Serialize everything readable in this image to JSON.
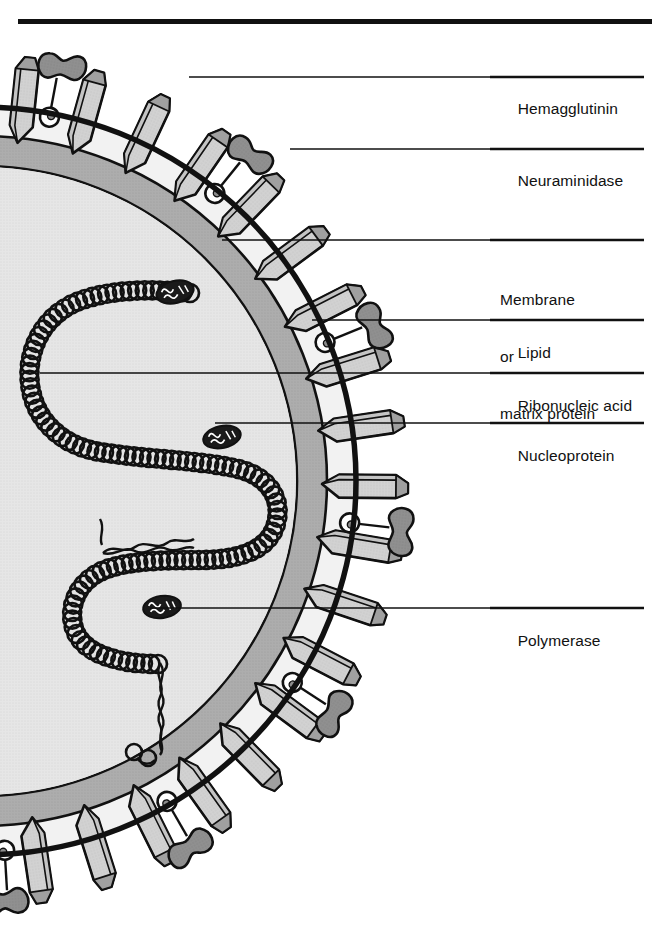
{
  "figure": {
    "top_rule": true,
    "colors": {
      "ink": "#111111",
      "membrane": "#111111",
      "envelope_fill": "#f2f2f2",
      "lipid_band": "#a9a9a9",
      "core_fill": "#e2e2e2",
      "spike_face": "#cfcfcf",
      "spike_shade": "#9a9a9a",
      "spike_top": "#bdbdbd",
      "neuraminidase_head": "#8d8d8d",
      "polymerase": "#1a1a1a",
      "page_background": "#ffffff"
    },
    "geometry": {
      "center_x": -18,
      "center_y": 481,
      "membrane_radius": 374,
      "lipid_outer_radius": 330,
      "lipid_inner_radius": 300
    }
  },
  "labels": [
    {
      "id": "hemagglutinin",
      "text": "Hemagglutinin",
      "lines": [
        "Hemagglutinin"
      ],
      "rule_y": 77,
      "text_x": 500,
      "text_y": 88,
      "leader_from_x": 189,
      "leader_to_x": 644
    },
    {
      "id": "neuraminidase",
      "text": "Neuraminidase",
      "lines": [
        "Neuraminidase"
      ],
      "rule_y": 149,
      "text_x": 500,
      "text_y": 160,
      "leader_from_x": 290,
      "leader_to_x": 644
    },
    {
      "id": "membrane-or-matrix-protein",
      "text": "Membrane or matrix protein",
      "lines": [
        "Membrane",
        "or",
        "matrix protein"
      ],
      "rule_y": 240,
      "text_x": 500,
      "text_y": 251,
      "leader_from_x": 222,
      "leader_to_x": 644
    },
    {
      "id": "lipid",
      "text": "Lipid",
      "lines": [
        "Lipid"
      ],
      "rule_y": 320,
      "text_x": 500,
      "text_y": 331,
      "leader_from_x": 312,
      "leader_to_x": 644
    },
    {
      "id": "ribonucleic-acid",
      "text": "Ribonucleic acid",
      "lines": [
        "Ribonucleic acid"
      ],
      "rule_y": 373,
      "text_x": 500,
      "text_y": 384,
      "leader_from_x": 40,
      "leader_to_x": 644
    },
    {
      "id": "nucleoprotein",
      "text": "Nucleoprotein",
      "lines": [
        "Nucleoprotein"
      ],
      "rule_y": 423,
      "text_x": 500,
      "text_y": 434,
      "leader_from_x": 215,
      "leader_to_x": 644
    },
    {
      "id": "polymerase",
      "text": "Polymerase",
      "lines": [
        "Polymerase"
      ],
      "rule_y": 608,
      "text_x": 500,
      "text_y": 619,
      "leader_from_x": 150,
      "leader_to_x": 644
    }
  ],
  "components": {
    "hemagglutinin": {
      "name": "Hemagglutinin",
      "shape": "rod-prism",
      "count": 21,
      "angles_deg": [
        -84,
        -74.5,
        -65,
        -55.5,
        -46,
        -36.5,
        -27,
        -17.5,
        -8.5,
        0.5,
        9.5,
        18.5,
        27.5,
        36.5,
        45.5,
        54.5,
        63.5,
        72.5,
        81.5,
        90.5,
        99.5
      ]
    },
    "neuraminidase": {
      "name": "Neuraminidase",
      "shape": "dumbbell-on-stalk",
      "count": 8,
      "angles_deg": [
        -79.5,
        -51,
        -22,
        6.5,
        33,
        60,
        86.5,
        104
      ]
    },
    "membrane": {
      "name": "Membrane or matrix protein",
      "shape": "outer-circle-ring"
    },
    "lipid": {
      "name": "Lipid",
      "shape": "gray-annulus"
    },
    "ribonucleic_acid": {
      "name": "Ribonucleic acid",
      "shape": "serpentine-bead-chain",
      "bead_count": 118
    },
    "nucleoprotein": {
      "name": "Nucleoprotein",
      "shape": "small-circle-bead"
    },
    "polymerase": {
      "name": "Polymerase",
      "shape": "hatched-ellipse",
      "count": 3,
      "positions": [
        [
          175,
          292
        ],
        [
          222,
          437
        ],
        [
          162,
          607
        ]
      ]
    }
  }
}
